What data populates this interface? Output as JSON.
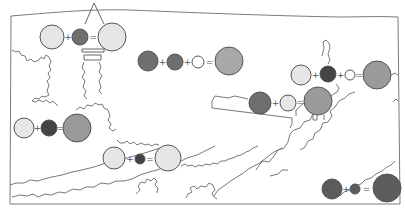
{
  "diagram": {
    "type": "map-with-circle-equations",
    "colors": {
      "light": "#e6e6e6",
      "white": "#ffffff",
      "medium": "#a8a8a8",
      "gray": "#9a9a9a",
      "dark": "#6f6f6f",
      "darker": "#5c5c5c",
      "darkest": "#444444",
      "stroke": "#555555",
      "line": "#6a6a6a"
    },
    "equations": [
      {
        "id": "eq1",
        "operators": [
          "+",
          "="
        ],
        "circles": [
          {
            "cx": 52,
            "cy": 37,
            "r": 12,
            "tone": "light"
          },
          {
            "cx": 80,
            "cy": 37,
            "r": 8,
            "tone": "dark"
          },
          {
            "cx": 112,
            "cy": 37,
            "r": 14,
            "tone": "light"
          }
        ]
      },
      {
        "id": "eq2",
        "operators": [
          "+",
          "+",
          "="
        ],
        "circles": [
          {
            "cx": 148,
            "cy": 61,
            "r": 10,
            "tone": "dark"
          },
          {
            "cx": 175,
            "cy": 62,
            "r": 8,
            "tone": "dark"
          },
          {
            "cx": 198,
            "cy": 62,
            "r": 6,
            "tone": "white"
          },
          {
            "cx": 229,
            "cy": 61,
            "r": 14,
            "tone": "medium"
          }
        ]
      },
      {
        "id": "eq3",
        "operators": [
          "+",
          "+",
          "="
        ],
        "circles": [
          {
            "cx": 301,
            "cy": 75,
            "r": 10,
            "tone": "light"
          },
          {
            "cx": 328,
            "cy": 74,
            "r": 8,
            "tone": "darkest"
          },
          {
            "cx": 350,
            "cy": 75,
            "r": 5,
            "tone": "white"
          },
          {
            "cx": 377,
            "cy": 75,
            "r": 14,
            "tone": "gray"
          }
        ]
      },
      {
        "id": "eq4",
        "operators": [
          "+",
          "="
        ],
        "circles": [
          {
            "cx": 260,
            "cy": 103,
            "r": 11,
            "tone": "dark"
          },
          {
            "cx": 288,
            "cy": 103,
            "r": 8,
            "tone": "light"
          },
          {
            "cx": 318,
            "cy": 101,
            "r": 14,
            "tone": "gray"
          }
        ]
      },
      {
        "id": "eq5",
        "operators": [
          "+",
          "="
        ],
        "circles": [
          {
            "cx": 24,
            "cy": 128,
            "r": 10,
            "tone": "light"
          },
          {
            "cx": 49,
            "cy": 128,
            "r": 8,
            "tone": "darkest"
          },
          {
            "cx": 77,
            "cy": 128,
            "r": 14,
            "tone": "gray"
          }
        ]
      },
      {
        "id": "eq6",
        "operators": [
          "+",
          "="
        ],
        "circles": [
          {
            "cx": 114,
            "cy": 158,
            "r": 11,
            "tone": "light"
          },
          {
            "cx": 140,
            "cy": 159,
            "r": 5,
            "tone": "darkest"
          },
          {
            "cx": 168,
            "cy": 158,
            "r": 13,
            "tone": "light"
          }
        ]
      },
      {
        "id": "eq7",
        "operators": [
          "+",
          "="
        ],
        "circles": [
          {
            "cx": 332,
            "cy": 189,
            "r": 10,
            "tone": "darker"
          },
          {
            "cx": 355,
            "cy": 189,
            "r": 5,
            "tone": "darker"
          },
          {
            "cx": 387,
            "cy": 188,
            "r": 14,
            "tone": "darker"
          }
        ]
      }
    ]
  }
}
